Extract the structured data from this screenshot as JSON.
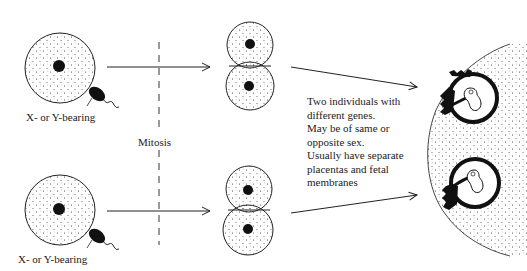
{
  "figure": {
    "labels": {
      "sperm_top": "X- or Y-bearing",
      "sperm_bottom": "X- or Y-bearing",
      "process": "Mitosis"
    },
    "description_lines": [
      "Two individuals with",
      "different genes.",
      "May be of same or",
      "opposite sex.",
      "Usually have separate",
      "placentas and fetal",
      "membranes"
    ],
    "stages": [
      "fertilized ovum",
      "two-cell stage",
      "implanted embryos in uterus"
    ],
    "colors": {
      "ink": "#111111",
      "background": "#ffffff"
    }
  }
}
